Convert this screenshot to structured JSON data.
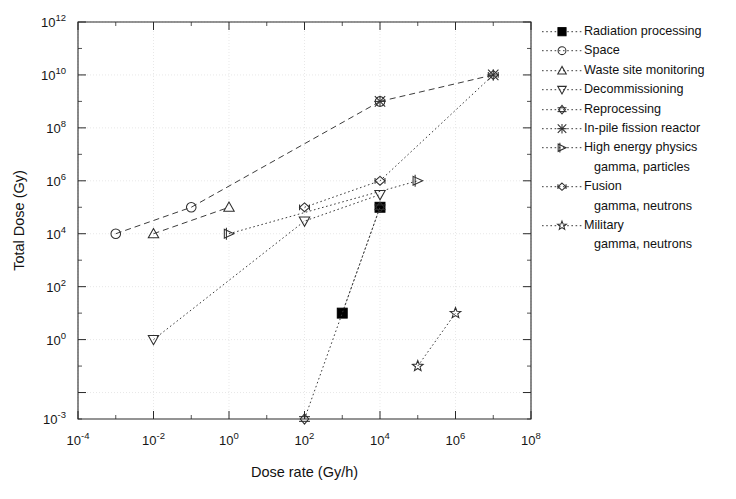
{
  "chart_data": {
    "type": "scatter",
    "title": "",
    "xlabel": "Dose rate (Gy/h)",
    "ylabel": "Total Dose (Gy)",
    "xscale": "log",
    "yscale": "log",
    "xlim": [
      0.0001,
      100000000.0
    ],
    "ylim": [
      0.001,
      1000000000000.0
    ],
    "xticklabels": [
      "10⁻⁴",
      "10⁻²",
      "10⁰",
      "10²",
      "10⁴",
      "10⁶",
      "10⁸"
    ],
    "xtick_base": [
      "10",
      "10",
      "10",
      "10",
      "10",
      "10",
      "10"
    ],
    "xtick_exp": [
      "-4",
      "-2",
      "0",
      "2",
      "4",
      "6",
      "8"
    ],
    "ytick_base": [
      "10",
      "10",
      "10",
      "10",
      "10",
      "10",
      "10",
      "10"
    ],
    "ytick_exp": [
      "12",
      "10",
      "8",
      "6",
      "4",
      "2",
      "0",
      "-3"
    ],
    "ytick_values": [
      1000000000000.0,
      10000000000.0,
      100000000.0,
      1000000.0,
      10000.0,
      100.0,
      1.0,
      0.001
    ],
    "grid": true,
    "legend_position": "right",
    "series": [
      {
        "name": "Radiation processing",
        "marker": "filled-square",
        "linestyle": "dotted",
        "points": [
          [
            1000,
            10
          ],
          [
            10000,
            100000
          ]
        ]
      },
      {
        "name": "Space",
        "marker": "open-circle",
        "linestyle": "dashed",
        "points": [
          [
            0.001,
            10000
          ],
          [
            0.1,
            100000
          ],
          [
            10000,
            1000000000
          ]
        ]
      },
      {
        "name": "Waste site monitoring",
        "marker": "triangle-up",
        "linestyle": "dashed",
        "points": [
          [
            0.01,
            10000
          ],
          [
            1,
            100000
          ]
        ]
      },
      {
        "name": "Decommissioning",
        "marker": "triangle-down",
        "linestyle": "dotted",
        "points": [
          [
            0.01,
            1
          ],
          [
            100,
            30000
          ],
          [
            10000,
            300000
          ]
        ]
      },
      {
        "name": "Reprocessing",
        "marker": "diamond-bar",
        "linestyle": "dotted",
        "points": [
          [
            100,
            0.001
          ],
          [
            10000,
            100000
          ]
        ]
      },
      {
        "name": "In-pile fission reactor",
        "marker": "x-star",
        "linestyle": "dashed",
        "points": [
          [
            10000,
            1000000000
          ],
          [
            10000000,
            10000000000
          ]
        ]
      },
      {
        "name": "High energy physics",
        "sublabel": "gamma, particles",
        "marker": "tri-arrow",
        "linestyle": "dotted",
        "points": [
          [
            1,
            10000
          ],
          [
            100000,
            1000000
          ]
        ]
      },
      {
        "name": "Fusion",
        "sublabel": "gamma, neutrons",
        "marker": "diamond-lr",
        "linestyle": "dotted",
        "points": [
          [
            100,
            100000
          ],
          [
            10000,
            1000000
          ],
          [
            10000000,
            10000000000
          ]
        ]
      },
      {
        "name": "Military",
        "sublabel": "gamma, neutrons",
        "marker": "star",
        "linestyle": "dotted",
        "points": [
          [
            100000,
            0.1
          ],
          [
            1000000,
            10
          ]
        ]
      }
    ]
  },
  "axes": {
    "x_title": "Dose rate (Gy/h)",
    "y_title": "Total Dose (Gy)"
  },
  "legend": {
    "items": [
      {
        "label": "Radiation processing",
        "sublabel": "",
        "marker": "filled-square"
      },
      {
        "label": "Space",
        "sublabel": "",
        "marker": "open-circle"
      },
      {
        "label": "Waste site monitoring",
        "sublabel": "",
        "marker": "triangle-up"
      },
      {
        "label": "Decommissioning",
        "sublabel": "",
        "marker": "triangle-down"
      },
      {
        "label": "Reprocessing",
        "sublabel": "",
        "marker": "diamond-bar"
      },
      {
        "label": "In-pile fission reactor",
        "sublabel": "",
        "marker": "x-star"
      },
      {
        "label": "High energy physics",
        "sublabel": "gamma, particles",
        "marker": "tri-arrow"
      },
      {
        "label": "Fusion",
        "sublabel": "gamma, neutrons",
        "marker": "diamond-lr"
      },
      {
        "label": "Military",
        "sublabel": "gamma, neutrons",
        "marker": "star"
      }
    ]
  },
  "colors": {
    "axis": "#2a2a2a",
    "grid": "#d9d9d9",
    "marker": "#2e2e2e",
    "background": "#ffffff"
  }
}
